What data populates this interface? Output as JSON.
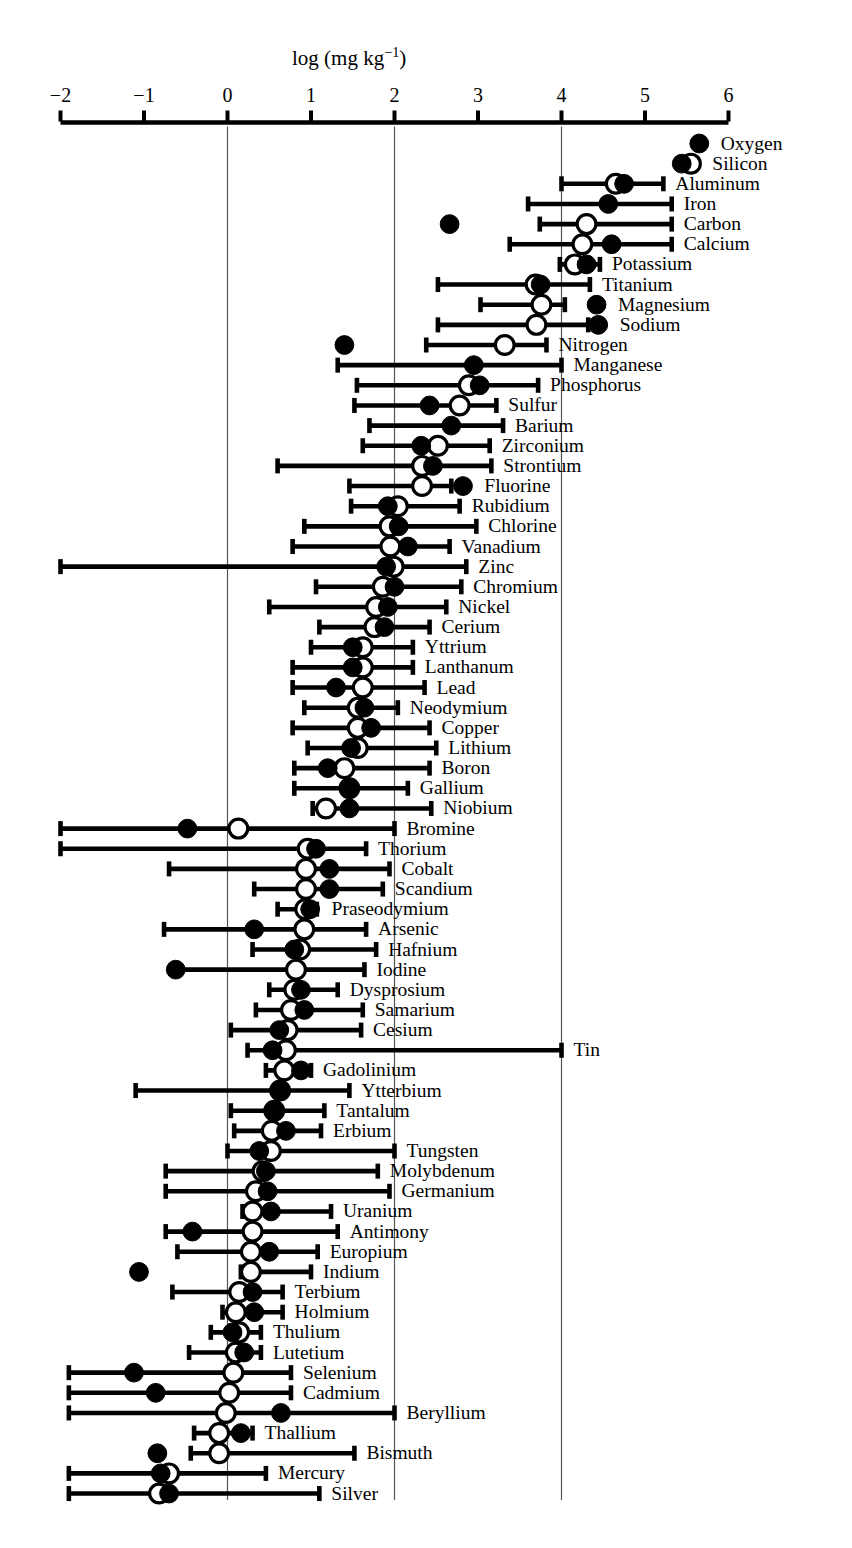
{
  "chart_data": {
    "type": "scatter",
    "title": "",
    "xlabel": "log (mg kg−1)",
    "xlabel_parts": {
      "pre": "log (mg kg",
      "sup": "−1",
      "post": ")"
    },
    "ylabel": "",
    "xlim": [
      -2,
      6
    ],
    "xticks": [
      -2,
      -1,
      0,
      1,
      2,
      3,
      4,
      5,
      6
    ],
    "xtick_labels": [
      "−2",
      "−1",
      "0",
      "1",
      "2",
      "3",
      "4",
      "5",
      "6"
    ],
    "gridlines_x": [
      0,
      2,
      4
    ],
    "grid": true,
    "legend": [],
    "series_names": [
      "filled-marker",
      "open-marker",
      "range-bar"
    ],
    "marker_legend": {
      "filled": "solid circle",
      "open": "hollow circle"
    },
    "categories": [
      "Oxygen",
      "Silicon",
      "Aluminum",
      "Iron",
      "Carbon",
      "Calcium",
      "Potassium",
      "Titanium",
      "Magnesium",
      "Sodium",
      "Nitrogen",
      "Manganese",
      "Phosphorus",
      "Sulfur",
      "Barium",
      "Zirconium",
      "Strontium",
      "Fluorine",
      "Rubidium",
      "Chlorine",
      "Vanadium",
      "Zinc",
      "Chromium",
      "Nickel",
      "Cerium",
      "Yttrium",
      "Lanthanum",
      "Lead",
      "Neodymium",
      "Copper",
      "Lithium",
      "Boron",
      "Gallium",
      "Niobium",
      "Bromine",
      "Thorium",
      "Cobalt",
      "Scandium",
      "Praseodymium",
      "Arsenic",
      "Hafnium",
      "Iodine",
      "Dysprosium",
      "Samarium",
      "Cesium",
      "Tin",
      "Gadolinium",
      "Ytterbium",
      "Tantalum",
      "Erbium",
      "Tungsten",
      "Molybdenum",
      "Germanium",
      "Uranium",
      "Antimony",
      "Europium",
      "Indium",
      "Terbium",
      "Holmium",
      "Thulium",
      "Lutetium",
      "Selenium",
      "Cadmium",
      "Beryllium",
      "Thallium",
      "Bismuth",
      "Mercury",
      "Silver"
    ],
    "rows": [
      {
        "label": "Oxygen",
        "filled": 5.65,
        "open": null,
        "low": null,
        "high": null
      },
      {
        "label": "Silicon",
        "filled": 5.44,
        "open": 5.55,
        "low": null,
        "high": null
      },
      {
        "label": "Aluminum",
        "filled": 4.75,
        "open": 4.65,
        "low": 4.0,
        "high": 5.22
      },
      {
        "label": "Iron",
        "filled": 4.56,
        "open": null,
        "low": 3.6,
        "high": 5.32
      },
      {
        "label": "Carbon",
        "filled": 2.66,
        "open": 4.3,
        "low": 3.74,
        "high": 5.32
      },
      {
        "label": "Calcium",
        "filled": 4.6,
        "open": 4.25,
        "low": 3.38,
        "high": 5.32
      },
      {
        "label": "Potassium",
        "filled": 4.3,
        "open": 4.16,
        "low": 3.98,
        "high": 4.46
      },
      {
        "label": "Titanium",
        "filled": 3.75,
        "open": 3.69,
        "low": 2.52,
        "high": 4.34
      },
      {
        "label": "Magnesium",
        "filled": 4.42,
        "open": 3.76,
        "low": 3.03,
        "high": 4.04
      },
      {
        "label": "Sodium",
        "filled": 4.44,
        "open": 3.7,
        "low": 2.52,
        "high": 4.32
      },
      {
        "label": "Nitrogen",
        "filled": 1.4,
        "open": 3.32,
        "low": 2.38,
        "high": 3.82
      },
      {
        "label": "Manganese",
        "filled": 2.95,
        "open": null,
        "low": 1.32,
        "high": 4.0
      },
      {
        "label": "Phosphorus",
        "filled": 3.02,
        "open": 2.89,
        "low": 1.55,
        "high": 3.72
      },
      {
        "label": "Sulfur",
        "filled": 2.42,
        "open": 2.78,
        "low": 1.52,
        "high": 3.22
      },
      {
        "label": "Barium",
        "filled": 2.68,
        "open": null,
        "low": 1.7,
        "high": 3.3
      },
      {
        "label": "Zirconium",
        "filled": 2.32,
        "open": 2.52,
        "low": 1.62,
        "high": 3.14
      },
      {
        "label": "Strontium",
        "filled": 2.46,
        "open": 2.33,
        "low": 0.6,
        "high": 3.16
      },
      {
        "label": "Fluorine",
        "filled": 2.82,
        "open": 2.33,
        "low": 1.46,
        "high": 2.68
      },
      {
        "label": "Rubidium",
        "filled": 1.92,
        "open": 2.04,
        "low": 1.48,
        "high": 2.78
      },
      {
        "label": "Chlorine",
        "filled": 2.05,
        "open": 1.94,
        "low": 0.92,
        "high": 2.98
      },
      {
        "label": "Vanadium",
        "filled": 2.16,
        "open": 1.95,
        "low": 0.78,
        "high": 2.66
      },
      {
        "label": "Zinc",
        "filled": 1.9,
        "open": 1.99,
        "low": -2.0,
        "high": 2.86
      },
      {
        "label": "Chromium",
        "filled": 2.0,
        "open": 1.86,
        "low": 1.06,
        "high": 2.8
      },
      {
        "label": "Nickel",
        "filled": 1.92,
        "open": 1.78,
        "low": 0.5,
        "high": 2.62
      },
      {
        "label": "Cerium",
        "filled": 1.88,
        "open": 1.76,
        "low": 1.1,
        "high": 2.42
      },
      {
        "label": "Yttrium",
        "filled": 1.5,
        "open": 1.62,
        "low": 1.0,
        "high": 2.22
      },
      {
        "label": "Lanthanum",
        "filled": 1.5,
        "open": 1.62,
        "low": 0.78,
        "high": 2.22
      },
      {
        "label": "Lead",
        "filled": 1.3,
        "open": 1.62,
        "low": 0.78,
        "high": 2.36
      },
      {
        "label": "Neodymium",
        "filled": 1.64,
        "open": 1.56,
        "low": 0.92,
        "high": 2.04
      },
      {
        "label": "Copper",
        "filled": 1.72,
        "open": 1.56,
        "low": 0.78,
        "high": 2.42
      },
      {
        "label": "Lithium",
        "filled": 1.48,
        "open": 1.56,
        "low": 0.96,
        "high": 2.5
      },
      {
        "label": "Boron",
        "filled": 1.2,
        "open": 1.4,
        "low": 0.8,
        "high": 2.42
      },
      {
        "label": "Gallium",
        "filled": 1.46,
        "open": 1.46,
        "low": 0.8,
        "high": 2.16
      },
      {
        "label": "Niobium",
        "filled": 1.46,
        "open": 1.18,
        "low": 1.02,
        "high": 2.44
      },
      {
        "label": "Bromine",
        "filled": -0.48,
        "open": 0.13,
        "low": -2.0,
        "high": 2.0
      },
      {
        "label": "Thorium",
        "filled": 1.06,
        "open": 0.96,
        "low": -2.0,
        "high": 1.66
      },
      {
        "label": "Cobalt",
        "filled": 1.22,
        "open": 0.94,
        "low": -0.7,
        "high": 1.94
      },
      {
        "label": "Scandium",
        "filled": 1.22,
        "open": 0.94,
        "low": 0.32,
        "high": 1.86
      },
      {
        "label": "Praseodymium",
        "filled": 0.99,
        "open": 0.93,
        "low": 0.6,
        "high": 1.07
      },
      {
        "label": "Arsenic",
        "filled": 0.32,
        "open": 0.92,
        "low": -0.76,
        "high": 1.66
      },
      {
        "label": "Hafnium",
        "filled": 0.8,
        "open": 0.87,
        "low": 0.3,
        "high": 1.78
      },
      {
        "label": "Iodine",
        "filled": -0.62,
        "open": 0.82,
        "low": -0.6,
        "high": 1.64
      },
      {
        "label": "Dysprosium",
        "filled": 0.88,
        "open": 0.8,
        "low": 0.5,
        "high": 1.32
      },
      {
        "label": "Samarium",
        "filled": 0.92,
        "open": 0.76,
        "low": 0.34,
        "high": 1.62
      },
      {
        "label": "Cesium",
        "filled": 0.62,
        "open": 0.72,
        "low": 0.04,
        "high": 1.6
      },
      {
        "label": "Tin",
        "filled": 0.54,
        "open": 0.7,
        "low": 0.24,
        "high": 4.0
      },
      {
        "label": "Gadolinium",
        "filled": 0.88,
        "open": 0.68,
        "low": 0.46,
        "high": 1.0
      },
      {
        "label": "Ytterbium",
        "filled": 0.63,
        "open": 0.63,
        "low": -1.1,
        "high": 1.46
      },
      {
        "label": "Tantalum",
        "filled": 0.56,
        "open": 0.56,
        "low": 0.04,
        "high": 1.16
      },
      {
        "label": "Erbium",
        "filled": 0.7,
        "open": 0.53,
        "low": 0.08,
        "high": 1.12
      },
      {
        "label": "Tungsten",
        "filled": 0.38,
        "open": 0.52,
        "low": 0.0,
        "high": 2.0
      },
      {
        "label": "Molybdenum",
        "filled": 0.46,
        "open": 0.42,
        "low": -0.74,
        "high": 1.8
      },
      {
        "label": "Germanium",
        "filled": 0.48,
        "open": 0.34,
        "low": -0.74,
        "high": 1.94
      },
      {
        "label": "Uranium",
        "filled": 0.52,
        "open": 0.3,
        "low": 0.18,
        "high": 1.24
      },
      {
        "label": "Antimony",
        "filled": -0.42,
        "open": 0.3,
        "low": -0.74,
        "high": 1.32
      },
      {
        "label": "Europium",
        "filled": 0.5,
        "open": 0.28,
        "low": -0.6,
        "high": 1.08
      },
      {
        "label": "Indium",
        "filled": -1.06,
        "open": 0.28,
        "low": 0.16,
        "high": 1.0
      },
      {
        "label": "Terbium",
        "filled": 0.3,
        "open": 0.14,
        "low": -0.66,
        "high": 0.66
      },
      {
        "label": "Holmium",
        "filled": 0.32,
        "open": 0.1,
        "low": -0.06,
        "high": 0.66
      },
      {
        "label": "Thulium",
        "filled": 0.06,
        "open": 0.14,
        "low": -0.2,
        "high": 0.4
      },
      {
        "label": "Lutetium",
        "filled": 0.2,
        "open": 0.1,
        "low": -0.46,
        "high": 0.4
      },
      {
        "label": "Selenium",
        "filled": -1.12,
        "open": 0.07,
        "low": -1.9,
        "high": 0.76
      },
      {
        "label": "Cadmium",
        "filled": -0.86,
        "open": 0.02,
        "low": -1.9,
        "high": 0.76
      },
      {
        "label": "Beryllium",
        "filled": 0.64,
        "open": -0.02,
        "low": -1.9,
        "high": 2.0
      },
      {
        "label": "Thallium",
        "filled": 0.16,
        "open": -0.1,
        "low": -0.4,
        "high": 0.3
      },
      {
        "label": "Bismuth",
        "filled": -0.84,
        "open": -0.1,
        "low": -0.44,
        "high": 1.52
      },
      {
        "label": "Mercury",
        "filled": -0.8,
        "open": -0.7,
        "low": -1.9,
        "high": 0.46
      },
      {
        "label": "Silver",
        "filled": -0.7,
        "open": -0.82,
        "low": -1.9,
        "high": 1.1
      }
    ]
  },
  "colors": {
    "ink": "#000000",
    "background": "#ffffff",
    "gridline": "#555555"
  }
}
